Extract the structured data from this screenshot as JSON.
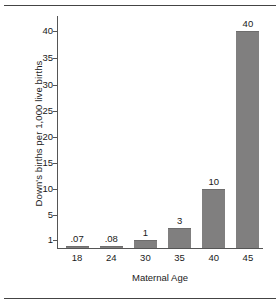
{
  "chart_data": {
    "type": "bar",
    "title": "",
    "xlabel": "Maternal Age",
    "ylabel": "Down's births per 1,000 live births",
    "categories": [
      "18",
      "24",
      "30",
      "35",
      "40",
      "45"
    ],
    "values": [
      0.07,
      0.08,
      1,
      3,
      10,
      40
    ],
    "data_labels": [
      ".07",
      ".08",
      "1",
      "3",
      "10",
      "40"
    ],
    "ytick_labels": [
      "1",
      "5",
      "10",
      "15",
      "20",
      "25",
      "30",
      "35",
      "40"
    ],
    "ytick_values": [
      1,
      5,
      10,
      15,
      20,
      25,
      30,
      35,
      40
    ],
    "ylim": [
      0,
      42
    ],
    "grid": false,
    "legend": null,
    "bar_color": "#807f7f",
    "axis_color": "#555555",
    "text_color": "#1a1a1a"
  }
}
